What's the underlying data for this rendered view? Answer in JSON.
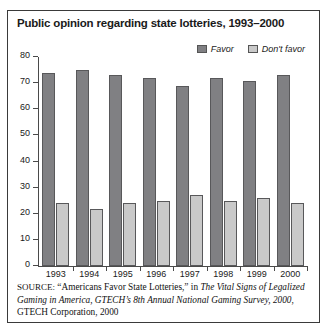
{
  "chart_data": {
    "type": "bar",
    "title": "Public opinion regarding state lotteries, 1993–2000",
    "xlabel": "",
    "ylabel": "",
    "categories": [
      "1993",
      "1994",
      "1995",
      "1996",
      "1997",
      "1998",
      "1999",
      "2000"
    ],
    "series": [
      {
        "name": "Favor",
        "color": "#808083",
        "values": [
          74,
          75,
          73,
          72,
          69,
          72,
          71,
          73
        ]
      },
      {
        "name": "Don't favor",
        "color": "#c9c9c9",
        "values": [
          24,
          22,
          24,
          25,
          27,
          25,
          26,
          24
        ]
      }
    ],
    "ylim": [
      0,
      80
    ],
    "yticks": [
      "0",
      "10",
      "20",
      "30",
      "40",
      "50",
      "60",
      "70",
      "80"
    ],
    "grid": false,
    "legend_position": "top-right"
  },
  "legend": {
    "entries": [
      {
        "label": "Favor",
        "swatch": "#808083"
      },
      {
        "label": "Don't favor",
        "swatch": "#c9c9c9"
      }
    ]
  },
  "source_note": {
    "prefix": "SOURCE:",
    "line1_quote": "“Americans Favor State Lotteries,”",
    "line1_in": " in ",
    "italic1": "The Vital Signs of Legalized Gaming in America, GTECH’s 8th Annual National Gaming Survey, 2000",
    "tail": ", GTECH Corporation, 2000"
  }
}
